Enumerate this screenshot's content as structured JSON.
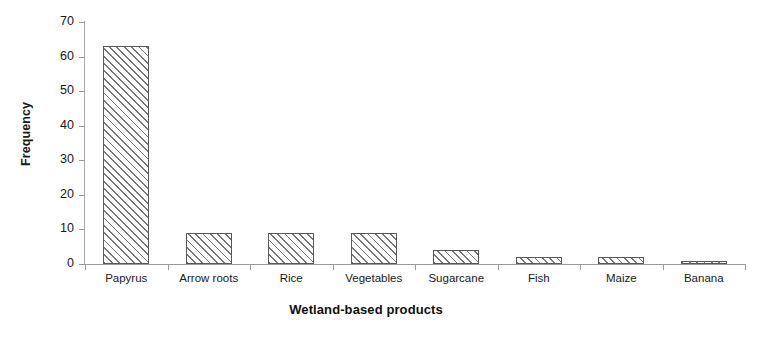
{
  "chart_data": {
    "type": "bar",
    "title": "",
    "xlabel": "Wetland-based products",
    "ylabel": "Frequency",
    "categories": [
      "Papyrus",
      "Arrow roots",
      "Rice",
      "Vegetables",
      "Sugarcane",
      "Fish",
      "Maize",
      "Banana"
    ],
    "values": [
      63,
      9,
      9,
      9,
      4,
      2,
      2,
      1
    ],
    "ylim": [
      0,
      70
    ],
    "ytick_labels": [
      "0",
      "10",
      "20",
      "30",
      "40",
      "50",
      "60",
      "70"
    ],
    "ytick_values": [
      0,
      10,
      20,
      30,
      40,
      50,
      60,
      70
    ],
    "grid": false,
    "legend": false,
    "bar_fill": "diagonal-hatch",
    "bar_border_color": "#595959",
    "axis_color": "#9a9a9a",
    "background": "#ffffff"
  }
}
